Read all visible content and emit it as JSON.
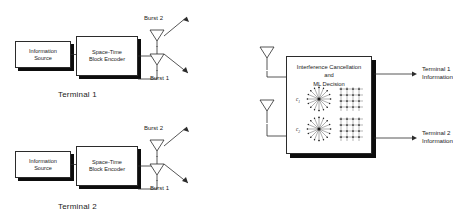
{
  "diagram": {
    "stroke_color": "#2b2b2b",
    "shadow_color": "#0d0d0d",
    "background": "#ffffff"
  },
  "transmitters": [
    {
      "id": "terminal-1",
      "caption": "Terminal 1",
      "source_box": {
        "line1": "Information",
        "line2": "Source"
      },
      "encoder_box": {
        "line1": "Space-Time",
        "line2": "Block Encoder"
      },
      "antennas": [
        {
          "id": "antenna-burst-2",
          "label": "Burst 2"
        },
        {
          "id": "antenna-burst-1",
          "label": "Burst 1"
        }
      ]
    },
    {
      "id": "terminal-2",
      "caption": "Terminal 2",
      "source_box": {
        "line1": "Information",
        "line2": "Source"
      },
      "encoder_box": {
        "line1": "Space-Time",
        "line2": "Block Encoder"
      },
      "antennas": [
        {
          "id": "antenna-burst-2",
          "label": "Burst 2"
        },
        {
          "id": "antenna-burst-1",
          "label": "Burst 1"
        }
      ]
    }
  ],
  "receiver": {
    "id": "receiver",
    "box": {
      "line1": "Interference Cancellation",
      "line2": "and",
      "line3": "ML Decision"
    },
    "antennas": [
      {
        "id": "rx-antenna-1"
      },
      {
        "id": "rx-antenna-2"
      }
    ],
    "constellations": [
      {
        "label": "c",
        "subscript": "1",
        "left_type": "psk-star",
        "right_type": "qam-grid"
      },
      {
        "label": "c",
        "subscript": "2",
        "left_type": "psk-star",
        "right_type": "qam-grid"
      }
    ],
    "outputs": [
      {
        "id": "output-terminal-1",
        "line1": "Terminal 1",
        "line2": "Information"
      },
      {
        "id": "output-terminal-2",
        "line1": "Terminal 2",
        "line2": "Information"
      }
    ]
  }
}
